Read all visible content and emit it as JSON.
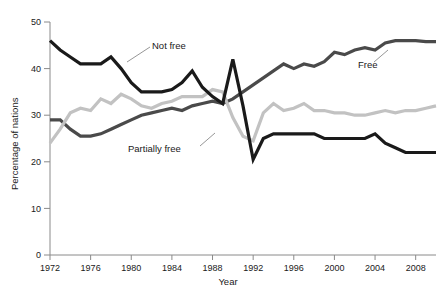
{
  "chart_data": {
    "type": "line",
    "title": "",
    "xlabel": "Year",
    "ylabel": "Percentage of nations",
    "xlim": [
      1972,
      2010
    ],
    "ylim": [
      0,
      50
    ],
    "grid": false,
    "legend_position": "inline-annotations",
    "x": [
      1972,
      1973,
      1974,
      1975,
      1976,
      1977,
      1978,
      1979,
      1980,
      1981,
      1982,
      1983,
      1984,
      1985,
      1986,
      1987,
      1988,
      1989,
      1990,
      1991,
      1992,
      1993,
      1994,
      1995,
      1996,
      1997,
      1998,
      1999,
      2000,
      2001,
      2002,
      2003,
      2004,
      2005,
      2006,
      2007,
      2008,
      2009,
      2010
    ],
    "xticks": [
      1972,
      1976,
      1980,
      1984,
      1988,
      1992,
      1996,
      2000,
      2004,
      2008
    ],
    "xtick_labels": [
      "1972",
      "1976",
      "1980",
      "1984",
      "1988",
      "1992",
      "1996",
      "2000",
      "2004",
      "2008"
    ],
    "yticks": [
      0,
      10,
      20,
      30,
      40,
      50
    ],
    "ytick_labels": [
      "0",
      "10",
      "20",
      "30",
      "40",
      "50"
    ],
    "series": [
      {
        "name": "Free",
        "color": "#4a4a4a",
        "annotation": "Free",
        "values": [
          29.0,
          29.0,
          27.0,
          25.5,
          25.5,
          26.0,
          27.0,
          28.0,
          29.0,
          30.0,
          30.5,
          31.0,
          31.5,
          31.0,
          32.0,
          32.5,
          33.0,
          32.5,
          33.5,
          35.0,
          36.5,
          38.0,
          39.5,
          41.0,
          40.0,
          41.0,
          40.5,
          41.5,
          43.5,
          43.0,
          44.0,
          44.5,
          44.0,
          45.5,
          46.0,
          46.0,
          46.0,
          45.8,
          45.8
        ]
      },
      {
        "name": "Partially free",
        "color": "#c2c2c2",
        "annotation": "Partially free",
        "values": [
          24.0,
          27.0,
          30.5,
          31.5,
          31.0,
          33.5,
          32.5,
          34.5,
          33.5,
          32.0,
          31.5,
          32.5,
          33.0,
          34.0,
          34.0,
          34.0,
          35.5,
          35.0,
          29.5,
          25.5,
          24.5,
          30.5,
          32.5,
          31.0,
          31.5,
          32.5,
          31.0,
          31.0,
          30.5,
          30.5,
          30.0,
          30.0,
          30.5,
          31.0,
          30.5,
          31.0,
          31.0,
          31.5,
          32.0
        ]
      },
      {
        "name": "Not free",
        "color": "#1a1a1a",
        "annotation": "Not free",
        "values": [
          46.0,
          44.0,
          42.5,
          41.0,
          41.0,
          41.0,
          42.5,
          40.0,
          37.0,
          35.0,
          35.0,
          35.0,
          35.5,
          37.0,
          39.5,
          36.0,
          34.0,
          32.5,
          42.0,
          32.0,
          20.5,
          25.0,
          26.0,
          26.0,
          26.0,
          26.0,
          26.0,
          25.0,
          25.0,
          25.0,
          25.0,
          25.0,
          26.0,
          24.0,
          23.0,
          22.0,
          22.0,
          22.0,
          22.0
        ]
      }
    ]
  }
}
